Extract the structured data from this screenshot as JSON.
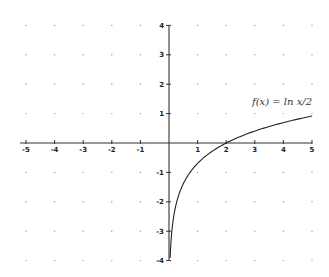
{
  "chart_data": {
    "type": "line",
    "title": "",
    "xlabel": "",
    "ylabel": "",
    "xlim": [
      -5,
      5
    ],
    "ylim": [
      -4,
      4
    ],
    "grid": "dots",
    "x_ticks": [
      -5,
      -4,
      -3,
      -2,
      -1,
      1,
      2,
      3,
      4,
      5
    ],
    "y_ticks": [
      -4,
      -3,
      -2,
      -1,
      1,
      2,
      3,
      4
    ],
    "x_tick_labels": [
      "-5",
      "-4",
      "-3",
      "-2",
      "-1",
      "1",
      "2",
      "3",
      "4",
      "5"
    ],
    "y_tick_labels": [
      "-4",
      "-3",
      "-2",
      "-1",
      "1",
      "2",
      "3",
      "4"
    ],
    "series": [
      {
        "name": "f(x) = ln(x/2)",
        "function": "ln(x/2)",
        "x_domain": [
          0.04,
          5
        ],
        "x": [
          0.04,
          0.1,
          0.2,
          0.3,
          0.5,
          0.75,
          1,
          1.5,
          2,
          2.5,
          3,
          3.5,
          4,
          4.5,
          5
        ],
        "y": [
          -3.91,
          -3.0,
          -2.3,
          -1.9,
          -1.39,
          -0.98,
          -0.69,
          -0.29,
          0,
          0.22,
          0.41,
          0.56,
          0.69,
          0.81,
          0.92
        ]
      }
    ],
    "annotations": [
      {
        "text": "f(x) = ln x/2",
        "x": 2.9,
        "y": 1.3
      }
    ]
  }
}
